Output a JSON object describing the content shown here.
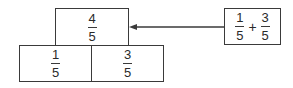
{
  "diagram": {
    "top_box": {
      "numerator": "4",
      "denominator": "5"
    },
    "bottom_boxes": [
      {
        "numerator": "1",
        "denominator": "5"
      },
      {
        "numerator": "3",
        "denominator": "5"
      }
    ],
    "sum_box": {
      "left": {
        "numerator": "1",
        "denominator": "5"
      },
      "operator": "+",
      "right": {
        "numerator": "3",
        "denominator": "5"
      }
    },
    "arrow": {
      "from": "sum_box",
      "to": "top_box",
      "direction": "left"
    },
    "colors": {
      "line": "#3a3a3a",
      "text": "#2a2a2a",
      "background": "#ffffff"
    }
  }
}
